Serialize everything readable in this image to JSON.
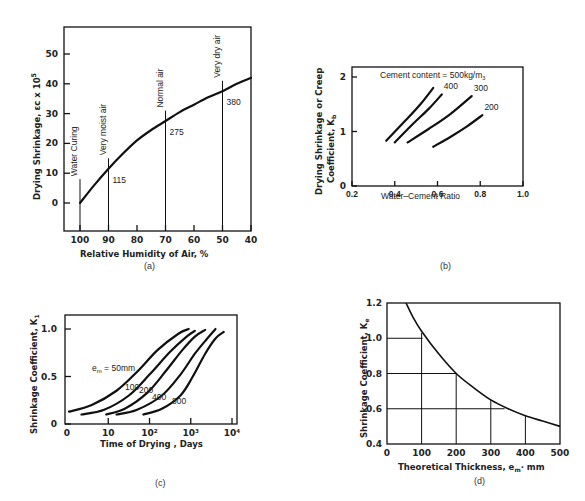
{
  "chart_data": [
    {
      "id": "a",
      "type": "line",
      "panel_label": "(a)",
      "title": "",
      "xlabel": "Relative Humidity of Air, %",
      "ylabel": "Drying Shrinkage, εc x 10⁵",
      "x_ticks": [
        100,
        90,
        80,
        70,
        60,
        50,
        40
      ],
      "y_ticks": [
        0,
        10,
        20,
        30,
        40,
        50
      ],
      "xlim": [
        105,
        40
      ],
      "ylim": [
        -10,
        60
      ],
      "x_reversed": true,
      "grid": false,
      "series": [
        {
          "name": "Drying shrinkage",
          "x": [
            100,
            95,
            90,
            85,
            80,
            75,
            70,
            65,
            60,
            55,
            50,
            45,
            40
          ],
          "y": [
            0,
            6,
            11.5,
            16.5,
            21,
            24.5,
            27.5,
            30.5,
            33,
            35.5,
            37.5,
            40,
            42
          ]
        }
      ],
      "markers": [
        {
          "x": 100,
          "label": "Water Curing",
          "value": "",
          "top": 8
        },
        {
          "x": 90,
          "label": "Very moist air",
          "value": "115",
          "top": 15
        },
        {
          "x": 70,
          "label": "Normal air",
          "value": "275",
          "top": 31
        },
        {
          "x": 50,
          "label": "Very dry air",
          "value": "380",
          "top": 41
        }
      ]
    },
    {
      "id": "b",
      "type": "line",
      "panel_label": "(b)",
      "title": "",
      "xlabel": "Water–Cement Ratio",
      "ylabel": "Drying Shrinkage or Creep Coefficient, Kb",
      "x_ticks": [
        "0.2",
        "0.4",
        "0.6",
        "0.8",
        "1.0"
      ],
      "y_ticks": [
        "0",
        "1",
        "2"
      ],
      "xlim": [
        0.2,
        1.0
      ],
      "ylim": [
        0,
        2.2
      ],
      "grid": false,
      "annotation": "Cement content = 500kg/m3",
      "series": [
        {
          "name": "500",
          "label": "",
          "x": [
            0.36,
            0.45,
            0.52,
            0.58
          ],
          "y": [
            0.83,
            1.2,
            1.5,
            1.8
          ]
        },
        {
          "name": "400",
          "label": "400",
          "x": [
            0.4,
            0.48,
            0.56,
            0.62
          ],
          "y": [
            0.8,
            1.12,
            1.42,
            1.68
          ]
        },
        {
          "name": "300",
          "label": "300",
          "x": [
            0.46,
            0.56,
            0.66,
            0.76
          ],
          "y": [
            0.8,
            1.05,
            1.32,
            1.65
          ]
        },
        {
          "name": "200",
          "label": "200",
          "x": [
            0.58,
            0.66,
            0.74,
            0.81
          ],
          "y": [
            0.72,
            0.9,
            1.1,
            1.3
          ]
        }
      ]
    },
    {
      "id": "c",
      "type": "line",
      "panel_label": "(c)",
      "title": "",
      "xlabel": "Time of Drying , Days",
      "ylabel": "Shrinkage Coefficient, K1",
      "x_ticks": [
        "0",
        "10",
        "10²",
        "10³",
        "10⁴"
      ],
      "x_scale": "log",
      "y_ticks": [
        "0",
        "0.5",
        "1.0"
      ],
      "ylim": [
        0,
        1.1
      ],
      "grid": false,
      "series": [
        {
          "name": "em = 50mm",
          "label": "eₘ = 50mm",
          "log_x": [
            0.05,
            0.6,
            1.2,
            1.7,
            2.2,
            2.7,
            2.95
          ],
          "y": [
            0.13,
            0.2,
            0.35,
            0.55,
            0.78,
            0.95,
            1.0
          ]
        },
        {
          "name": "em = 100mm",
          "label": "100",
          "log_x": [
            0.35,
            0.9,
            1.5,
            2.0,
            2.5,
            2.9,
            3.1
          ],
          "y": [
            0.1,
            0.15,
            0.3,
            0.52,
            0.76,
            0.92,
            0.98
          ]
        },
        {
          "name": "em = 200mm",
          "label": "200",
          "log_x": [
            0.95,
            1.4,
            1.95,
            2.4,
            2.8,
            3.1,
            3.35
          ],
          "y": [
            0.1,
            0.16,
            0.33,
            0.56,
            0.78,
            0.92,
            0.99
          ]
        },
        {
          "name": "em = 400mm",
          "label": "400",
          "log_x": [
            1.2,
            1.7,
            2.3,
            2.75,
            3.1,
            3.4,
            3.6
          ],
          "y": [
            0.1,
            0.15,
            0.3,
            0.52,
            0.74,
            0.9,
            1.0
          ]
        },
        {
          "name": "em = 800mm",
          "label": "800",
          "log_x": [
            1.85,
            2.3,
            2.75,
            3.05,
            3.35,
            3.6,
            3.8
          ],
          "y": [
            0.1,
            0.16,
            0.3,
            0.5,
            0.74,
            0.9,
            0.97
          ]
        }
      ]
    },
    {
      "id": "d",
      "type": "line",
      "panel_label": "(d)",
      "title": "",
      "xlabel": "Theoretical Thickness, em, mm",
      "ylabel": "Shrinkage Coefficient, Ke",
      "x_ticks": [
        "0",
        "100",
        "200",
        "300",
        "400",
        "500"
      ],
      "y_ticks": [
        "0.4",
        "0.6",
        "0.8",
        "1.0",
        "1.2"
      ],
      "xlim": [
        0,
        500
      ],
      "ylim": [
        0.4,
        1.2
      ],
      "grid": false,
      "series": [
        {
          "name": "Ke",
          "x": [
            55,
            75,
            100,
            150,
            200,
            250,
            300,
            350,
            400,
            450,
            500
          ],
          "y": [
            1.2,
            1.12,
            1.04,
            0.91,
            0.8,
            0.72,
            0.65,
            0.6,
            0.56,
            0.53,
            0.5
          ]
        }
      ],
      "reference_lines": [
        {
          "x": 100,
          "y": 1.0
        },
        {
          "x": 200,
          "y": 0.8
        },
        {
          "x": 300,
          "y": 0.6
        },
        {
          "x": 400,
          "y": 0.56
        }
      ]
    }
  ],
  "labels": {
    "a_x": "Relative Humidity of Air, %",
    "a_y": "Drying Shrinkage, εc x 10",
    "a_y_exp": "5",
    "b_x": "Water–Cement Ratio",
    "b_y1": "Drying Shrinkage or Creep",
    "b_y2": "Coefficient, K",
    "b_y2_sub": "b",
    "b_annot": "Cement content = 500kg/m",
    "b_annot_sub": "3",
    "c_x": "Time of Drying , Days",
    "c_y": "Shrinkage Coefficient, K",
    "c_y_sub": "1",
    "c_em": "e",
    "c_em_sub": "m",
    "c_em_rest": " = 50mm",
    "d_x": "Theoretical Thickness, e",
    "d_x_sub": "m",
    "d_x_rest": "· mm",
    "d_y": "Shrinkage Coefficient, K",
    "d_y_sub": "e",
    "pa": "(a)",
    "pb": "(b)",
    "pc": "(c)",
    "pd": "(d)"
  }
}
